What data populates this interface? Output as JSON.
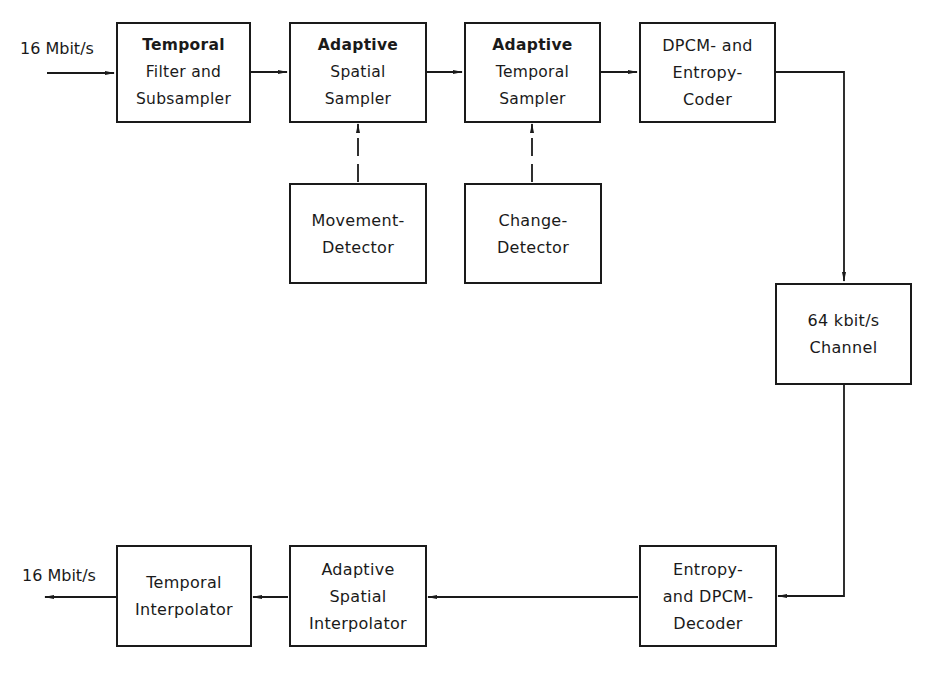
{
  "diagram": {
    "type": "block-diagram",
    "line_color": "#1a1a1a",
    "input_label": "16 Mbit/s",
    "output_label": "16 Mbit/s",
    "blocks": {
      "temporal_filter": {
        "line1": "Temporal",
        "line2": "Filter and",
        "line3": "Subsampler"
      },
      "adaptive_spatial_sampler": {
        "line1": "Adaptive",
        "line2": "Spatial",
        "line3": "Sampler"
      },
      "adaptive_temporal_sampler": {
        "line1": "Adaptive",
        "line2": "Temporal",
        "line3": "Sampler"
      },
      "dpcm_entropy_coder": {
        "line1": "DPCM- and",
        "line2": "Entropy-",
        "line3": "Coder"
      },
      "movement_detector": {
        "line1": "Movement-",
        "line2": "Detector"
      },
      "change_detector": {
        "line1": "Change-",
        "line2": "Detector"
      },
      "channel": {
        "line1": "64 kbit/s",
        "line2": "Channel"
      },
      "entropy_dpcm_decoder": {
        "line1": "Entropy-",
        "line2": "and DPCM-",
        "line3": "Decoder"
      },
      "adaptive_spatial_interpolator": {
        "line1": "Adaptive",
        "line2": "Spatial",
        "line3": "Interpolator"
      },
      "temporal_interpolator": {
        "line1": "Temporal",
        "line2": "Interpolator"
      }
    },
    "connections": [
      {
        "from": "input",
        "to": "temporal_filter",
        "style": "solid"
      },
      {
        "from": "temporal_filter",
        "to": "adaptive_spatial_sampler",
        "style": "solid"
      },
      {
        "from": "adaptive_spatial_sampler",
        "to": "adaptive_temporal_sampler",
        "style": "solid"
      },
      {
        "from": "adaptive_temporal_sampler",
        "to": "dpcm_entropy_coder",
        "style": "solid"
      },
      {
        "from": "movement_detector",
        "to": "adaptive_spatial_sampler",
        "style": "dashed"
      },
      {
        "from": "change_detector",
        "to": "adaptive_temporal_sampler",
        "style": "dashed"
      },
      {
        "from": "dpcm_entropy_coder",
        "to": "channel",
        "style": "solid"
      },
      {
        "from": "channel",
        "to": "entropy_dpcm_decoder",
        "style": "solid"
      },
      {
        "from": "entropy_dpcm_decoder",
        "to": "adaptive_spatial_interpolator",
        "style": "solid"
      },
      {
        "from": "adaptive_spatial_interpolator",
        "to": "temporal_interpolator",
        "style": "solid"
      },
      {
        "from": "temporal_interpolator",
        "to": "output",
        "style": "solid"
      }
    ]
  }
}
